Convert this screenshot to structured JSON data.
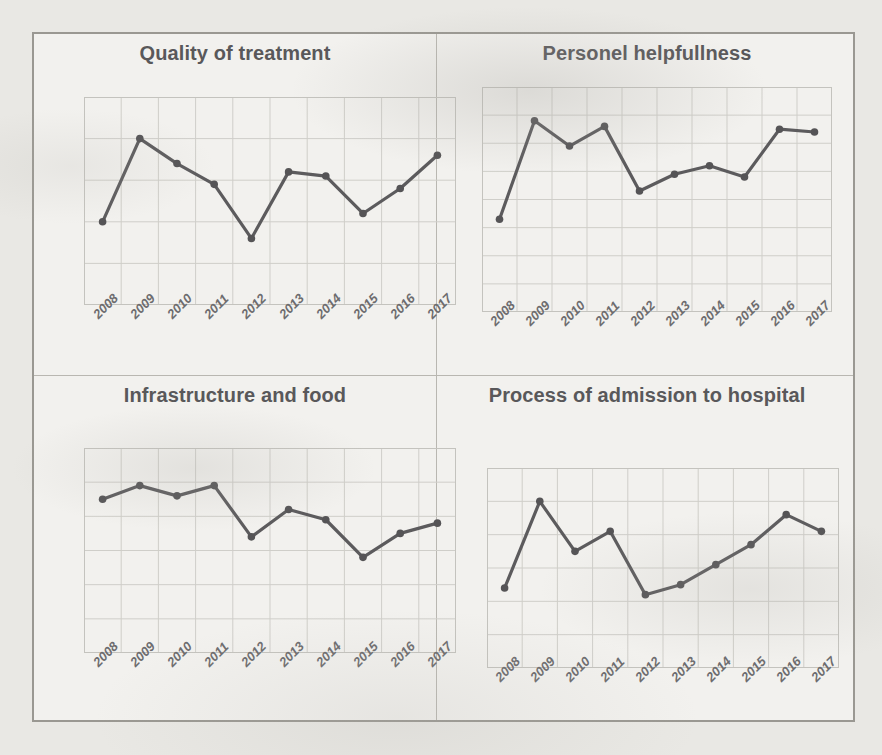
{
  "page": {
    "background_color": "#e9e8e4",
    "frame_border_color": "#9a9892",
    "panel_background": "#f2f1ee"
  },
  "style": {
    "line_color": "#5c5b5d",
    "marker_color": "#555456",
    "grid_color": "#cfcec9",
    "plot_border_color": "#c4c3be",
    "title_color": "#59585a",
    "tick_color": "#6d6c6e"
  },
  "panels": [
    {
      "id": "q1",
      "title": "Quality of treatment"
    },
    {
      "id": "q2",
      "title": "Personel helpfullness"
    },
    {
      "id": "q3",
      "title": "Infrastructure and food"
    },
    {
      "id": "q4",
      "title": "Process of admission to hospital"
    }
  ],
  "chart_data": [
    {
      "type": "line",
      "title": "Quality of treatment",
      "xlabel": "",
      "ylabel": "",
      "grid": true,
      "legend": "none",
      "x": [
        2008,
        2009,
        2010,
        2011,
        2012,
        2013,
        2014,
        2015,
        2016,
        2017
      ],
      "categories": [
        "2008",
        "2009",
        "2010",
        "2011",
        "2012",
        "2013",
        "2014",
        "2015",
        "2016",
        "2017"
      ],
      "ylim": [
        0,
        5
      ],
      "yticks": [
        0,
        1,
        2,
        3,
        4,
        5
      ],
      "xgrid_lines": 10,
      "series": [
        {
          "name": "Quality of treatment",
          "values": [
            2.0,
            4.0,
            3.4,
            2.9,
            1.6,
            3.2,
            3.1,
            2.2,
            2.8,
            3.6
          ]
        }
      ]
    },
    {
      "type": "line",
      "title": "Personel helpfullness",
      "xlabel": "",
      "ylabel": "",
      "grid": true,
      "legend": "none",
      "x": [
        2008,
        2009,
        2010,
        2011,
        2012,
        2013,
        2014,
        2015,
        2016,
        2017
      ],
      "categories": [
        "2008",
        "2009",
        "2010",
        "2011",
        "2012",
        "2013",
        "2014",
        "2015",
        "2016",
        "2017"
      ],
      "ylim": [
        0,
        8
      ],
      "yticks": [
        0,
        1,
        2,
        3,
        4,
        5,
        6,
        7,
        8
      ],
      "xgrid_lines": 10,
      "series": [
        {
          "name": "Personel helpfullness",
          "values": [
            3.3,
            6.8,
            5.9,
            6.6,
            4.3,
            4.9,
            5.2,
            4.8,
            6.5,
            6.4
          ]
        }
      ]
    },
    {
      "type": "line",
      "title": "Infrastructure and food",
      "xlabel": "",
      "ylabel": "",
      "grid": true,
      "legend": "none",
      "x": [
        2008,
        2009,
        2010,
        2011,
        2012,
        2013,
        2014,
        2015,
        2016,
        2017
      ],
      "categories": [
        "2008",
        "2009",
        "2010",
        "2011",
        "2012",
        "2013",
        "2014",
        "2015",
        "2016",
        "2017"
      ],
      "ylim": [
        0,
        6
      ],
      "yticks": [
        0,
        1,
        2,
        3,
        4,
        5,
        6
      ],
      "xgrid_lines": 10,
      "series": [
        {
          "name": "Infrastructure and food",
          "values": [
            4.5,
            4.9,
            4.6,
            4.9,
            3.4,
            4.2,
            3.9,
            2.8,
            3.5,
            3.8
          ]
        }
      ]
    },
    {
      "type": "line",
      "title": "Process of admission to hospital",
      "xlabel": "",
      "ylabel": "",
      "grid": true,
      "legend": "none",
      "x": [
        2008,
        2009,
        2010,
        2011,
        2012,
        2013,
        2014,
        2015,
        2016,
        2017
      ],
      "categories": [
        "2008",
        "2009",
        "2010",
        "2011",
        "2012",
        "2013",
        "2014",
        "2015",
        "2016",
        "2017"
      ],
      "ylim": [
        0,
        6
      ],
      "yticks": [
        0,
        1,
        2,
        3,
        4,
        5,
        6
      ],
      "xgrid_lines": 10,
      "series": [
        {
          "name": "Process of admission to hospital",
          "values": [
            2.4,
            5.0,
            3.5,
            4.1,
            2.2,
            2.5,
            3.1,
            3.7,
            4.6,
            4.1
          ]
        }
      ]
    }
  ]
}
